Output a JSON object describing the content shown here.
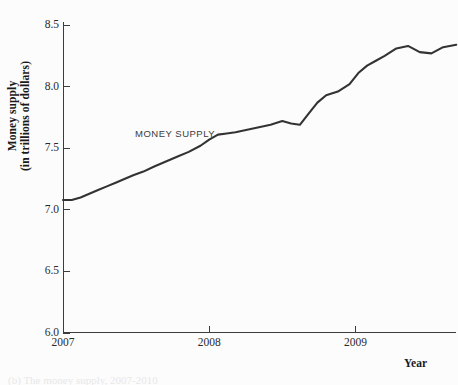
{
  "figure": {
    "background_color": "#fcfcfc",
    "line_color": "#333333",
    "axis_color": "#3c3c3c",
    "annotation_label": "MONEY SUPPLY",
    "x_axis_title": "Year",
    "y_axis_title_line1": "Money supply",
    "y_axis_title_line2": "(in trillions of dollars)",
    "bottom_caption": "(b) The money supply, 2007-2010"
  },
  "chart_data": {
    "type": "line",
    "title": "",
    "xlabel": "Year",
    "ylabel": "Money supply (in trillions of dollars)",
    "xlim": [
      2007.0,
      2009.69
    ],
    "ylim": [
      6.0,
      8.5
    ],
    "grid": false,
    "legend": "inline-annotation",
    "legend_position": "inside-left",
    "x_tick_labels": [
      "2007",
      "2008",
      "2009"
    ],
    "x_tick_values": [
      2007,
      2008,
      2009
    ],
    "y_tick_labels": [
      "6.0",
      "6.5",
      "7.0",
      "7.5",
      "8.0",
      "8.5"
    ],
    "y_tick_values": [
      6.0,
      6.5,
      7.0,
      7.5,
      8.0,
      8.5
    ],
    "series": [
      {
        "name": "MONEY SUPPLY",
        "color": "#333333",
        "x": [
          2007.0,
          2007.06,
          2007.12,
          2007.18,
          2007.24,
          2007.3,
          2007.36,
          2007.42,
          2007.48,
          2007.55,
          2007.62,
          2007.7,
          2007.78,
          2007.86,
          2007.94,
          2008.0,
          2008.06,
          2008.12,
          2008.18,
          2008.26,
          2008.34,
          2008.42,
          2008.5,
          2008.56,
          2008.62,
          2008.68,
          2008.74,
          2008.8,
          2008.88,
          2008.96,
          2009.02,
          2009.08,
          2009.14,
          2009.2,
          2009.28,
          2009.36,
          2009.44,
          2009.52,
          2009.6,
          2009.69
        ],
        "y": [
          7.08,
          7.08,
          7.1,
          7.13,
          7.16,
          7.19,
          7.22,
          7.25,
          7.28,
          7.31,
          7.35,
          7.39,
          7.43,
          7.47,
          7.52,
          7.57,
          7.61,
          7.62,
          7.63,
          7.65,
          7.67,
          7.69,
          7.72,
          7.7,
          7.69,
          7.78,
          7.87,
          7.93,
          7.96,
          8.02,
          8.11,
          8.17,
          8.21,
          8.25,
          8.31,
          8.33,
          8.28,
          8.27,
          8.32,
          8.34
        ]
      }
    ]
  }
}
